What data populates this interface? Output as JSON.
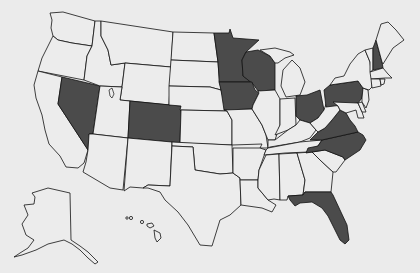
{
  "map": {
    "title": "United States map with highlighted states",
    "colors": {
      "background": "#ebebeb",
      "state_fill": "#ececec",
      "highlight_fill": "#4b4b4b",
      "border": "#111111"
    },
    "highlighted_states": [
      "Nevada",
      "Colorado",
      "Minnesota",
      "Wisconsin",
      "Iowa",
      "Ohio",
      "Pennsylvania",
      "New Hampshire",
      "Virginia",
      "North Carolina",
      "Florida"
    ],
    "other_states": [
      "Washington",
      "Oregon",
      "California",
      "Idaho",
      "Montana",
      "Wyoming",
      "Utah",
      "Arizona",
      "New Mexico",
      "North Dakota",
      "South Dakota",
      "Nebraska",
      "Kansas",
      "Oklahoma",
      "Texas",
      "Missouri",
      "Arkansas",
      "Louisiana",
      "Illinois",
      "Michigan",
      "Indiana",
      "Kentucky",
      "Tennessee",
      "Mississippi",
      "Alabama",
      "Georgia",
      "South Carolina",
      "West Virginia",
      "Maryland",
      "Delaware",
      "New Jersey",
      "New York",
      "Connecticut",
      "Rhode Island",
      "Massachusetts",
      "Vermont",
      "Maine",
      "Alaska",
      "Hawaii"
    ]
  }
}
